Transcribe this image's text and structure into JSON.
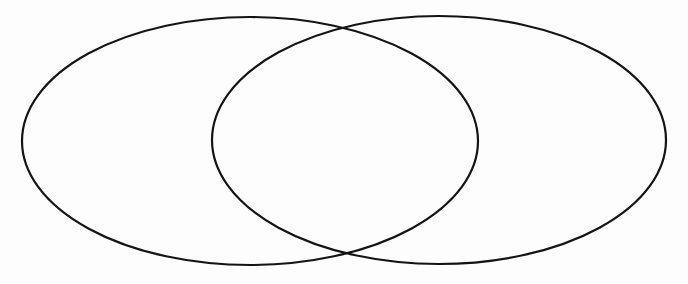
{
  "figure": {
    "kind": "venn-diagram",
    "title": "",
    "background_color": "#fdfdfd",
    "width": 688,
    "height": 284,
    "set_count": 2,
    "labels": {
      "left_set": "",
      "right_set": "",
      "intersection": ""
    }
  },
  "style": {
    "stroke_color": "#141414",
    "stroke_width": 2.2,
    "fill": "none",
    "fill_opacity": 0
  },
  "chart_data": {
    "type": "diagram",
    "subtype": "venn",
    "title": "",
    "xlabel": "",
    "ylabel": "",
    "grid": false,
    "legend": "none",
    "viewbox": [
      0,
      0,
      688,
      284
    ],
    "shapes": [
      {
        "name": "left-set-ellipse",
        "shape": "ellipse",
        "cx": 250,
        "cy": 141,
        "rx": 228,
        "ry": 124,
        "bounds": {
          "left": 22,
          "right": 478,
          "top": 17,
          "bottom": 265
        },
        "stroke": "#141414",
        "stroke_width": 2.2,
        "fill": "none",
        "label": ""
      },
      {
        "name": "right-set-ellipse",
        "shape": "ellipse",
        "cx": 439,
        "cy": 140,
        "rx": 227,
        "ry": 124,
        "bounds": {
          "left": 212,
          "right": 666,
          "top": 16,
          "bottom": 264
        },
        "stroke": "#141414",
        "stroke_width": 2.2,
        "fill": "none",
        "label": ""
      }
    ],
    "intersections": [
      {
        "name": "upper-crossing-point",
        "x": 340,
        "y": 26
      },
      {
        "name": "lower-crossing-point",
        "x": 340,
        "y": 253
      }
    ],
    "overlap": {
      "name": "intersection-lens",
      "left": 212,
      "right": 478,
      "top": 16,
      "bottom": 265,
      "label": ""
    }
  }
}
